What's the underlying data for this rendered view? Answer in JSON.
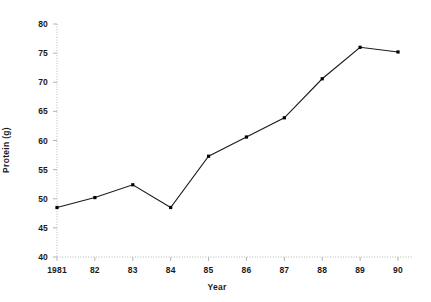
{
  "chart_data": {
    "type": "line",
    "title": "",
    "subtitle": "",
    "xlabel": "Year",
    "ylabel": "Protein (g)",
    "x": [
      1981,
      1982,
      1983,
      1984,
      1985,
      1986,
      1987,
      1988,
      1989,
      1990
    ],
    "xtick_labels": [
      "1981",
      "82",
      "83",
      "84",
      "85",
      "86",
      "87",
      "88",
      "89",
      "90"
    ],
    "values": [
      48.5,
      50.2,
      52.4,
      48.5,
      57.3,
      60.6,
      63.9,
      70.6,
      76.0,
      75.2
    ],
    "ytick_labels": [
      "40",
      "45",
      "50",
      "55",
      "60",
      "65",
      "70",
      "75",
      "80"
    ],
    "yticks": [
      40,
      45,
      50,
      55,
      60,
      65,
      70,
      75,
      80
    ],
    "ylim": [
      40,
      80
    ],
    "xlim": [
      1981,
      1990
    ],
    "grid": false,
    "legend": null,
    "legend_position": "none",
    "marker": "square",
    "line_color": "#1a1a1a",
    "marker_color": "#000000",
    "axis_color": "#b4b4b4",
    "background_color": "#ffffff",
    "series": [
      {
        "name": "Protein (g)",
        "values": [
          48.5,
          50.2,
          52.4,
          48.5,
          57.3,
          60.6,
          63.9,
          70.6,
          76.0,
          75.2
        ]
      }
    ]
  }
}
